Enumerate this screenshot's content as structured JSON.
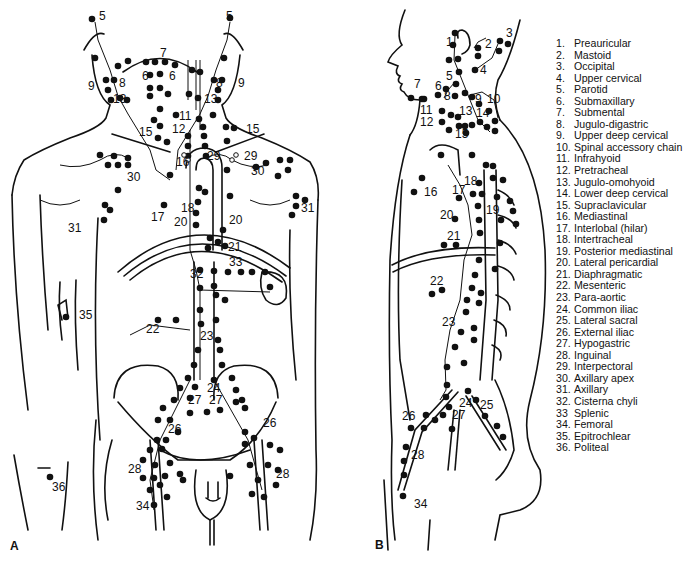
{
  "figure": {
    "panel_a_label": "A",
    "panel_b_label": "B",
    "panel_a_title": "Anterior view of lymph node stations",
    "panel_b_title": "Lateral view of lymph node stations"
  },
  "panel_a_labels": [
    {
      "text": "5",
      "x": 99,
      "y": 20
    },
    {
      "text": "5",
      "x": 226,
      "y": 20
    },
    {
      "text": "7",
      "x": 160,
      "y": 57
    },
    {
      "text": "6",
      "x": 142,
      "y": 80
    },
    {
      "text": "6",
      "x": 169,
      "y": 80
    },
    {
      "text": "8",
      "x": 119,
      "y": 87
    },
    {
      "text": "8",
      "x": 216,
      "y": 87
    },
    {
      "text": "9",
      "x": 88,
      "y": 90
    },
    {
      "text": "9",
      "x": 238,
      "y": 87
    },
    {
      "text": "13",
      "x": 113,
      "y": 103
    },
    {
      "text": "13",
      "x": 204,
      "y": 103
    },
    {
      "text": "11",
      "x": 179,
      "y": 120
    },
    {
      "text": "12",
      "x": 172,
      "y": 133
    },
    {
      "text": "15",
      "x": 139,
      "y": 136
    },
    {
      "text": "15",
      "x": 246,
      "y": 133
    },
    {
      "text": "29",
      "x": 207,
      "y": 160
    },
    {
      "text": "29",
      "x": 244,
      "y": 160
    },
    {
      "text": "16",
      "x": 176,
      "y": 166
    },
    {
      "text": "30",
      "x": 127,
      "y": 181
    },
    {
      "text": "30",
      "x": 251,
      "y": 175
    },
    {
      "text": "18",
      "x": 181,
      "y": 212
    },
    {
      "text": "17",
      "x": 151,
      "y": 221
    },
    {
      "text": "31",
      "x": 68,
      "y": 232
    },
    {
      "text": "31",
      "x": 301,
      "y": 212
    },
    {
      "text": "20",
      "x": 174,
      "y": 226
    },
    {
      "text": "20",
      "x": 229,
      "y": 224
    },
    {
      "text": "21",
      "x": 228,
      "y": 251
    },
    {
      "text": "33",
      "x": 229,
      "y": 266
    },
    {
      "text": "32",
      "x": 190,
      "y": 278
    },
    {
      "text": "35",
      "x": 79,
      "y": 319
    },
    {
      "text": "22",
      "x": 146,
      "y": 333
    },
    {
      "text": "23",
      "x": 200,
      "y": 340
    },
    {
      "text": "24",
      "x": 207,
      "y": 392
    },
    {
      "text": "27",
      "x": 188,
      "y": 404
    },
    {
      "text": "27",
      "x": 209,
      "y": 404
    },
    {
      "text": "26",
      "x": 168,
      "y": 433
    },
    {
      "text": "26",
      "x": 263,
      "y": 427
    },
    {
      "text": "28",
      "x": 128,
      "y": 473
    },
    {
      "text": "28",
      "x": 276,
      "y": 478
    },
    {
      "text": "36",
      "x": 52,
      "y": 491
    },
    {
      "text": "34",
      "x": 136,
      "y": 510
    }
  ],
  "panel_b_labels": [
    {
      "text": "1",
      "x": 446,
      "y": 46
    },
    {
      "text": "2",
      "x": 485,
      "y": 48
    },
    {
      "text": "3",
      "x": 506,
      "y": 37
    },
    {
      "text": "4",
      "x": 480,
      "y": 74
    },
    {
      "text": "5",
      "x": 446,
      "y": 80
    },
    {
      "text": "7",
      "x": 414,
      "y": 88
    },
    {
      "text": "6",
      "x": 435,
      "y": 90
    },
    {
      "text": "8",
      "x": 444,
      "y": 100
    },
    {
      "text": "9",
      "x": 475,
      "y": 103
    },
    {
      "text": "10",
      "x": 487,
      "y": 103
    },
    {
      "text": "11",
      "x": 420,
      "y": 114
    },
    {
      "text": "13",
      "x": 459,
      "y": 115
    },
    {
      "text": "14",
      "x": 476,
      "y": 117
    },
    {
      "text": "12",
      "x": 420,
      "y": 126
    },
    {
      "text": "15",
      "x": 455,
      "y": 138
    },
    {
      "text": "16",
      "x": 424,
      "y": 196
    },
    {
      "text": "18",
      "x": 464,
      "y": 185
    },
    {
      "text": "17",
      "x": 452,
      "y": 194
    },
    {
      "text": "19",
      "x": 486,
      "y": 214
    },
    {
      "text": "20",
      "x": 440,
      "y": 219
    },
    {
      "text": "21",
      "x": 447,
      "y": 240
    },
    {
      "text": "22",
      "x": 430,
      "y": 285
    },
    {
      "text": "23",
      "x": 442,
      "y": 326
    },
    {
      "text": "24",
      "x": 459,
      "y": 407
    },
    {
      "text": "25",
      "x": 480,
      "y": 409
    },
    {
      "text": "26",
      "x": 402,
      "y": 420
    },
    {
      "text": "27",
      "x": 452,
      "y": 419
    },
    {
      "text": "28",
      "x": 411,
      "y": 459
    },
    {
      "text": "34",
      "x": 414,
      "y": 508
    }
  ],
  "legend": {
    "items": [
      {
        "num": "1.",
        "label": "Preauricular"
      },
      {
        "num": "2.",
        "label": "Mastoid"
      },
      {
        "num": "3.",
        "label": "Occipital"
      },
      {
        "num": "4.",
        "label": "Upper cervical"
      },
      {
        "num": "5.",
        "label": "Parotid"
      },
      {
        "num": "6.",
        "label": "Submaxillary"
      },
      {
        "num": "7.",
        "label": "Submental"
      },
      {
        "num": "8.",
        "label": "Jugulo-digastric"
      },
      {
        "num": "9.",
        "label": "Upper deep cervical"
      },
      {
        "num": "10.",
        "label": "Spinal accessory chain"
      },
      {
        "num": "11.",
        "label": "Infrahyoid"
      },
      {
        "num": "12.",
        "label": "Pretracheal"
      },
      {
        "num": "13.",
        "label": "Jugulo-omohyoid"
      },
      {
        "num": "14.",
        "label": "Lower deep cervical"
      },
      {
        "num": "15.",
        "label": "Supraclavicular"
      },
      {
        "num": "16.",
        "label": "Mediastinal"
      },
      {
        "num": "17.",
        "label": "Interlobal (hilar)"
      },
      {
        "num": "18.",
        "label": "Intertracheal"
      },
      {
        "num": "19.",
        "label": "Posterior mediastinal"
      },
      {
        "num": "20.",
        "label": "Lateral pericardial"
      },
      {
        "num": "21.",
        "label": "Diaphragmatic"
      },
      {
        "num": "22.",
        "label": "Mesenteric"
      },
      {
        "num": "23.",
        "label": "Para-aortic"
      },
      {
        "num": "24.",
        "label": "Common iliac"
      },
      {
        "num": "25.",
        "label": "Lateral sacral"
      },
      {
        "num": "26.",
        "label": "External iliac"
      },
      {
        "num": "27.",
        "label": "Hypogastric"
      },
      {
        "num": "28.",
        "label": "Inguinal"
      },
      {
        "num": "29.",
        "label": "Interpectoral"
      },
      {
        "num": "30.",
        "label": "Axillary apex"
      },
      {
        "num": "31.",
        "label": "Axillary"
      },
      {
        "num": "32.",
        "label": "Cisterna chyli"
      },
      {
        "num": "33",
        "label": "Splenic"
      },
      {
        "num": "34.",
        "label": "Femoral"
      },
      {
        "num": "35.",
        "label": "Epitrochlear"
      },
      {
        "num": "36.",
        "label": "Politeal"
      }
    ]
  },
  "colors": {
    "line": "#111111",
    "background": "#ffffff"
  }
}
